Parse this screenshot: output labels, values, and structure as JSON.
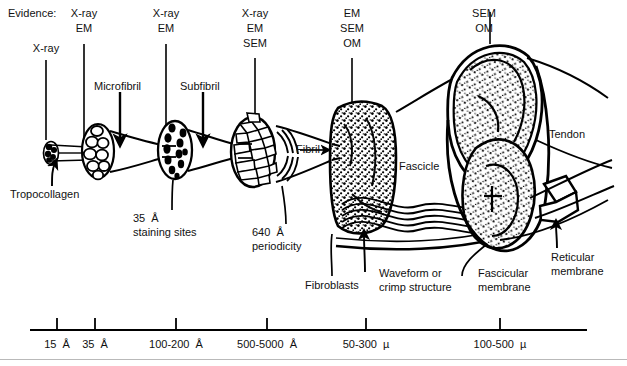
{
  "figure": {
    "type": "hierarchical-structure-diagram",
    "evidence_header": "Evidence:"
  },
  "evidence_columns": [
    {
      "id": "tropocollagen",
      "x": 57,
      "methods": "X-ray",
      "lines": [
        "X-ray"
      ]
    },
    {
      "id": "microfibril",
      "x": 95,
      "methods": "X-ray EM",
      "lines": [
        "X-ray",
        "EM"
      ]
    },
    {
      "id": "subfibril",
      "x": 176,
      "methods": "X-ray EM",
      "lines": [
        "X-ray",
        "EM"
      ]
    },
    {
      "id": "fibril",
      "x": 267,
      "methods": "X-ray EM SEM",
      "lines": [
        "X-ray",
        "EM",
        "SEM"
      ]
    },
    {
      "id": "fascicle",
      "x": 366,
      "methods": "EM SEM OM",
      "lines": [
        "EM",
        "SEM",
        "OM"
      ]
    },
    {
      "id": "tendon",
      "x": 500,
      "methods": "SEM OM",
      "lines": [
        "SEM",
        "OM"
      ]
    }
  ],
  "structure_labels": [
    {
      "name": "microfibril-label",
      "text": "Microfibril"
    },
    {
      "name": "subfibril-label",
      "text": "Subfibril"
    },
    {
      "name": "fibril-label",
      "text": "Fibril"
    },
    {
      "name": "fascicle-label",
      "text": "Fascicle"
    },
    {
      "name": "tendon-label",
      "text": "Tendon"
    },
    {
      "name": "tropocollagen-label",
      "text": "Tropocollagen"
    },
    {
      "name": "staining-sites-label",
      "text": "35  Å\nstaining sites"
    },
    {
      "name": "periodicity-label",
      "text": "640  Å\nperiodicity"
    },
    {
      "name": "fibroblasts-label",
      "text": "Fibroblasts"
    },
    {
      "name": "crimp-label",
      "text": "Waveform or\ncrimp structure"
    },
    {
      "name": "fascicular-membrane-label",
      "text": "Fascicular\nmembrane"
    },
    {
      "name": "reticular-membrane-label",
      "text": "Reticular\nmembrane"
    }
  ],
  "labels": {
    "evidence": "Evidence:",
    "microfibril": "Microfibril",
    "subfibril": "Subfibril",
    "fibril": "Fibril",
    "fascicle": "Fascicle",
    "tendon": "Tendon",
    "tropocollagen": "Tropocollagen",
    "staining_sites_value": "35  Å",
    "staining_sites_text": "staining sites",
    "periodicity_value": "640  Å",
    "periodicity_text": "periodicity",
    "fibroblasts": "Fibroblasts",
    "crimp_line1": "Waveform or",
    "crimp_line2": "crimp structure",
    "fascicular_line1": "Fascicular",
    "fascicular_line2": "membrane",
    "reticular_line1": "Reticular",
    "reticular_line2": "membrane"
  },
  "evidence_text": {
    "c1_l1": "X-ray",
    "c2_l1": "X-ray",
    "c2_l2": "EM",
    "c3_l1": "X-ray",
    "c3_l2": "EM",
    "c4_l1": "X-ray",
    "c4_l2": "EM",
    "c4_l3": "SEM",
    "c5_l1": "EM",
    "c5_l2": "SEM",
    "c5_l3": "OM",
    "c6_l1": "SEM",
    "c6_l2": "OM"
  },
  "scale": {
    "axis_label": "",
    "ticks": [
      {
        "x": 57,
        "label": "15 Å"
      },
      {
        "x": 95,
        "label": "35 Å"
      },
      {
        "x": 176,
        "label": "100-200 Å"
      },
      {
        "x": 267,
        "label": "500-5000 Å"
      },
      {
        "x": 366,
        "label": "50-300 µ"
      },
      {
        "x": 500,
        "label": "100-500 µ"
      }
    ],
    "tick_labels": {
      "t1": "15  Å",
      "t2": "35  Å",
      "t3": "100-200  Å",
      "t4": "500-5000  Å",
      "t5": "50-300  µ",
      "t6": "100-500  µ"
    }
  },
  "colors": {
    "ink": "#000000",
    "paper": "#ffffff",
    "rule": "#b9b9b9"
  }
}
